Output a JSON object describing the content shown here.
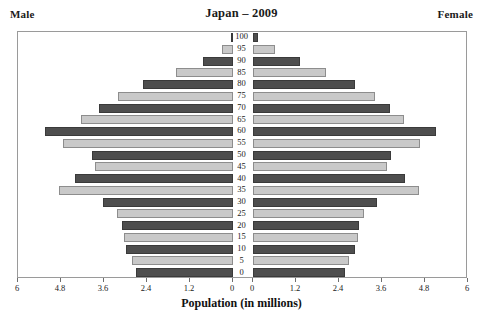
{
  "header": {
    "male_label": "Male",
    "female_label": "Female",
    "title": "Japan – 2009"
  },
  "axis": {
    "x_title": "Population (in millions)",
    "x_ticks_left": [
      "6",
      "4.8",
      "3.6",
      "2.4",
      "1.2",
      "0"
    ],
    "x_ticks_right": [
      "0",
      "1.2",
      "2.4",
      "3.6",
      "4.8",
      "6"
    ],
    "age_ticks": [
      "100",
      "95",
      "90",
      "85",
      "80",
      "75",
      "70",
      "65",
      "60",
      "55",
      "50",
      "45",
      "40",
      "35",
      "30",
      "25",
      "20",
      "15",
      "10",
      "5",
      "0"
    ]
  },
  "colors": {
    "dark_bar": "#4e4e4e",
    "light_bar": "#c9c9c9",
    "frame": "#9a9a9a",
    "text": "#1a1a1a",
    "background": "#ffffff"
  },
  "chart_data": {
    "type": "bar",
    "subtype": "population-pyramid",
    "title": "Japan – 2009",
    "xlabel": "Population (in millions)",
    "ylabel": "",
    "xlim": [
      0,
      6
    ],
    "grid": false,
    "legend_position": "none",
    "categories": [
      "0",
      "5",
      "10",
      "15",
      "20",
      "25",
      "30",
      "35",
      "40",
      "45",
      "50",
      "55",
      "60",
      "65",
      "70",
      "75",
      "80",
      "85",
      "90",
      "95",
      "100"
    ],
    "series": [
      {
        "name": "Male",
        "side": "left",
        "axis_direction": "right-to-left",
        "values": [
          2.72,
          2.82,
          2.98,
          3.04,
          3.1,
          3.25,
          3.62,
          4.85,
          4.4,
          3.86,
          3.94,
          4.75,
          5.25,
          4.25,
          3.75,
          3.2,
          2.5,
          1.6,
          0.85,
          0.32,
          0.05
        ]
      },
      {
        "name": "Female",
        "side": "right",
        "axis_direction": "left-to-right",
        "values": [
          2.58,
          2.68,
          2.85,
          2.92,
          2.96,
          3.1,
          3.46,
          4.62,
          4.24,
          3.75,
          3.86,
          4.65,
          5.12,
          4.22,
          3.82,
          3.4,
          2.86,
          2.05,
          1.3,
          0.62,
          0.14
        ]
      }
    ],
    "bar_shading": {
      "pattern": "alternating",
      "note": "age groups alternate dark/light by row, starting dark at age 0"
    }
  }
}
